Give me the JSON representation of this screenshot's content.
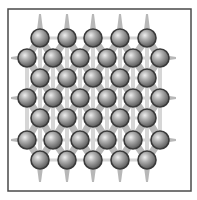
{
  "figure": {
    "type": "crystal-lattice-diagram",
    "frame": {
      "x": 8,
      "y": 9,
      "width": 183,
      "height": 182,
      "stroke": "#4a4a4a",
      "stroke_width": 1.5
    },
    "colors": {
      "background": "#ffffff",
      "bond": "#b8b8b8",
      "bond_light": "#d6d6d6",
      "sphere_fill_light": "#e8e8e8",
      "sphere_fill_mid": "#9a9a9a",
      "sphere_fill_dark": "#5a5a5a",
      "sphere_outline": "#3a3a3a"
    },
    "sphere_radius": 9,
    "rows": [
      {
        "y": 38,
        "xs": [
          40,
          67,
          93,
          120,
          147
        ]
      },
      {
        "y": 58,
        "xs": [
          27,
          53,
          80,
          107,
          133,
          160
        ]
      },
      {
        "y": 78,
        "xs": [
          40,
          67,
          93,
          120,
          147
        ]
      },
      {
        "y": 98,
        "xs": [
          27,
          53,
          80,
          107,
          133,
          160
        ]
      },
      {
        "y": 118,
        "xs": [
          40,
          67,
          93,
          120,
          147
        ]
      },
      {
        "y": 140,
        "xs": [
          27,
          53,
          80,
          107,
          133,
          160
        ]
      },
      {
        "y": 160,
        "xs": [
          40,
          67,
          93,
          120,
          147
        ]
      }
    ],
    "sphere_count": 38
  }
}
